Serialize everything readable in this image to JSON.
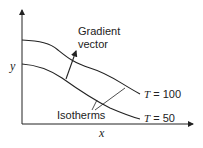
{
  "diagram": {
    "axes": {
      "x_label": "x",
      "y_label": "y"
    },
    "annotation_gradient": {
      "line1": "Gradient",
      "line2": "vector"
    },
    "annotation_isotherms": "Isotherms",
    "curves": [
      {
        "var": "T",
        "eq": " = 100"
      },
      {
        "var": "T",
        "eq": " = 50"
      }
    ]
  }
}
